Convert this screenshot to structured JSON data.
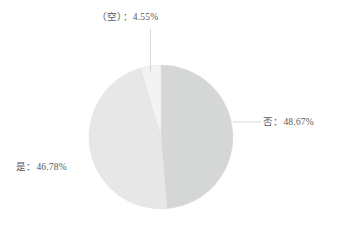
{
  "chart_data": {
    "type": "pie",
    "title": "",
    "subtitle": "",
    "xlabel": "",
    "ylabel": "",
    "legend_position": "none",
    "grid": false,
    "label_format": "{name}：{percent}%",
    "start_angle_deg": 0,
    "direction": "clockwise",
    "categories": [
      "否",
      "是",
      "（空）"
    ],
    "values": [
      48.67,
      46.78,
      4.55
    ],
    "unit": "%",
    "slices": [
      {
        "name": "否",
        "percent": 48.67,
        "percent_text": "48.67%",
        "label": "否：48.67%",
        "color": "#d5d6d6",
        "leader_line": true
      },
      {
        "name": "是",
        "percent": 46.78,
        "percent_text": "46.78%",
        "label": "是：46.78%",
        "color": "#e7e7e7",
        "leader_line": false
      },
      {
        "name": "（空）",
        "percent": 4.55,
        "percent_text": "4.55%",
        "label": "（空）：4.55%",
        "color": "#f3f3f3",
        "leader_line": true
      }
    ]
  },
  "labels": {
    "empty": "（空）：4.55%",
    "no": "否：48.67%",
    "yes": "是：46.78%"
  },
  "colors": {
    "background": "#ffffff",
    "text": "#58595b",
    "slice_no": "#d5d6d6",
    "slice_yes": "#e7e7e7",
    "slice_empty": "#f3f3f3",
    "leader_line": "#c7c7c7",
    "slice_border": "#e0e0e0"
  }
}
